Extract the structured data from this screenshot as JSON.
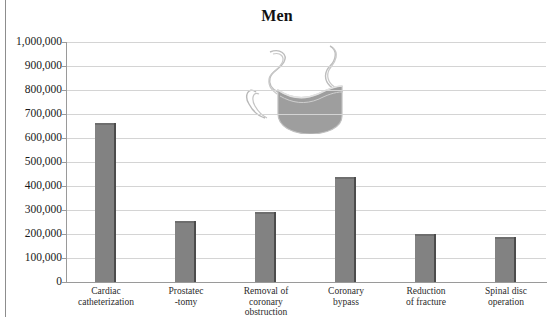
{
  "figure": {
    "title": "Men",
    "top_cut_text": "",
    "illustration": "surgical-mask-illustration"
  },
  "colors": {
    "bar_fill": "#828282",
    "bar_edge": "#4c4c4c",
    "gridline": "#d4d4d4",
    "axis": "#9a9a9a",
    "text": "#1a1a1a",
    "page_rule": "#8d8d8d"
  },
  "chart_data": {
    "type": "bar",
    "title": "Men",
    "xlabel": "",
    "ylabel": "",
    "ylim": [
      0,
      1000000
    ],
    "ytick_step": 100000,
    "grid": true,
    "legend": null,
    "categories": [
      "Cardiac catheterization",
      "Prostatec -tomy",
      "Removal of coronary obstruction",
      "Coronary bypass",
      "Reduction of fracture",
      "Spinal disc operation"
    ],
    "category_lines": [
      [
        "Cardiac",
        "catheterization"
      ],
      [
        "Prostatec",
        "-tomy"
      ],
      [
        "Removal of",
        "coronary",
        "obstruction"
      ],
      [
        "Coronary",
        "bypass"
      ],
      [
        "Reduction",
        "of fracture"
      ],
      [
        "Spinal disc",
        "operation"
      ]
    ],
    "values": [
      662000,
      255000,
      292000,
      438000,
      200000,
      188000
    ],
    "ytick_labels": [
      "1,000,000",
      "900,000",
      "800,000",
      "700,000",
      "600,000",
      "500,000",
      "400,000",
      "300,000",
      "200,000",
      "100,000",
      "0"
    ],
    "ytick_values": [
      1000000,
      900000,
      800000,
      700000,
      600000,
      500000,
      400000,
      300000,
      200000,
      100000,
      0
    ]
  }
}
